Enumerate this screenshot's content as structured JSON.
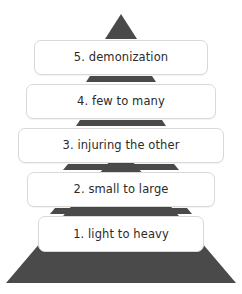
{
  "diagram": {
    "type": "pyramid",
    "orientation": "apex-up",
    "level_count": 5,
    "background_color": "#ffffff",
    "pyramid_color": "#4a4a4a",
    "box_fill_color": "#ffffff",
    "box_border_color": "#d9d9d9",
    "text_color": "#2b2b2b",
    "apex_icon": "triangle-up-icon",
    "levels": [
      {
        "rank": "5",
        "label": "5. demonization",
        "position": "top"
      },
      {
        "rank": "4",
        "label": "4. few to many",
        "position": "upper-middle"
      },
      {
        "rank": "3",
        "label": "3. injuring the other",
        "position": "middle"
      },
      {
        "rank": "2",
        "label": "2. small to large",
        "position": "lower-middle"
      },
      {
        "rank": "1",
        "label": "1. light to heavy",
        "position": "bottom"
      }
    ],
    "connectors": [
      {
        "between": "5-4"
      },
      {
        "between": "4-3"
      },
      {
        "between": "3-2"
      },
      {
        "between": "2-1"
      }
    ]
  }
}
